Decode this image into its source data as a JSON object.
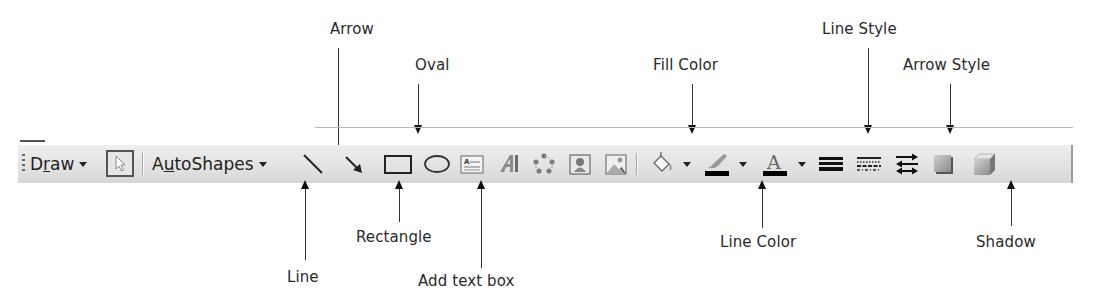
{
  "toolbar": {
    "name": "Drawing toolbar",
    "draw_menu": {
      "label": "Draw",
      "mnemonic": "r"
    },
    "select_objects": {
      "icon": "pointer-arrow-icon",
      "state": "pressed"
    },
    "autoshapes_menu": {
      "label": "AutoShapes",
      "mnemonic": "u"
    },
    "buttons": [
      {
        "id": "line",
        "icon": "line-icon"
      },
      {
        "id": "arrow",
        "icon": "arrow-icon"
      },
      {
        "id": "rectangle",
        "icon": "rectangle-icon"
      },
      {
        "id": "oval",
        "icon": "oval-icon"
      },
      {
        "id": "text-box",
        "icon": "text-box-icon"
      },
      {
        "id": "wordart",
        "icon": "wordart-icon"
      },
      {
        "id": "diagram",
        "icon": "diagram-icon"
      },
      {
        "id": "clip-art",
        "icon": "clip-art-icon"
      },
      {
        "id": "picture",
        "icon": "picture-icon"
      },
      {
        "id": "fill-color",
        "icon": "paint-bucket-icon",
        "dropdown": true
      },
      {
        "id": "line-color",
        "icon": "paintbrush-icon",
        "dropdown": true,
        "swatch": "#000000"
      },
      {
        "id": "font-color",
        "icon": "font-color-a-icon",
        "dropdown": true,
        "swatch": "#000000"
      },
      {
        "id": "line-style",
        "icon": "line-style-icon"
      },
      {
        "id": "dash-style",
        "icon": "dash-style-icon"
      },
      {
        "id": "arrow-style",
        "icon": "arrow-style-icon"
      },
      {
        "id": "shadow-style",
        "icon": "shadow-icon"
      },
      {
        "id": "3d-style",
        "icon": "3d-cube-icon"
      }
    ]
  },
  "callouts": {
    "arrow": "Arrow",
    "oval": "Oval",
    "fill_color": "Fill Color",
    "line_style": "Line Style",
    "arrow_style": "Arrow Style",
    "line": "Line",
    "rectangle": "Rectangle",
    "add_text_box": "Add text box",
    "line_color": "Line Color",
    "shadow": "Shadow"
  },
  "colors": {
    "toolbar_bg": "#e4e4e4",
    "callout_text": "#2a2a2a",
    "callout_line": "#333333"
  }
}
